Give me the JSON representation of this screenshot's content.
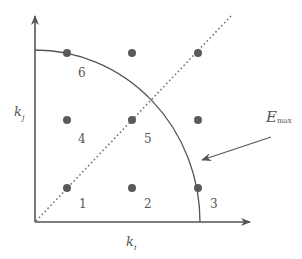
{
  "diagram": {
    "title": "",
    "axes": {
      "x_label": {
        "base": "k",
        "sub": "i"
      },
      "y_label": {
        "base": "k",
        "sub": "j"
      }
    },
    "contour_label": {
      "base": "E",
      "sub": "max"
    },
    "points": [
      {
        "id": "1",
        "label": "1",
        "col": 1,
        "row": 1
      },
      {
        "id": "2",
        "label": "2",
        "col": 2,
        "row": 1
      },
      {
        "id": "3",
        "label": "3",
        "col": 3,
        "row": 1
      },
      {
        "id": "4",
        "label": "4",
        "col": 1,
        "row": 2
      },
      {
        "id": "5",
        "label": "5",
        "col": 2,
        "row": 2
      },
      {
        "id": "6",
        "label": "6",
        "col": 1,
        "row": 3
      },
      {
        "id": "",
        "label": "",
        "col": 2,
        "row": 3
      },
      {
        "id": "",
        "label": "",
        "col": 3,
        "row": 3
      },
      {
        "id": "",
        "label": "",
        "col": 3,
        "row": 2
      }
    ],
    "elements": {
      "diagonal": "dotted line k_i = k_j",
      "contour": "quarter circle of constant energy E_max",
      "arrow": "arrow pointing to contour"
    },
    "colors": {
      "line": "#555555",
      "dot": "#5a5a5a",
      "background": "#ffffff"
    }
  }
}
